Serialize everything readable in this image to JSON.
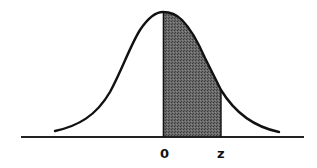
{
  "figure": {
    "type": "normal-distribution-curve",
    "labels": {
      "zero": "0",
      "z": "z"
    },
    "shaded_region": {
      "from": "0",
      "to": "z"
    },
    "colors": {
      "curve": "#111111",
      "axis": "#222222",
      "shade": "#555555",
      "background": "#ffffff"
    }
  }
}
